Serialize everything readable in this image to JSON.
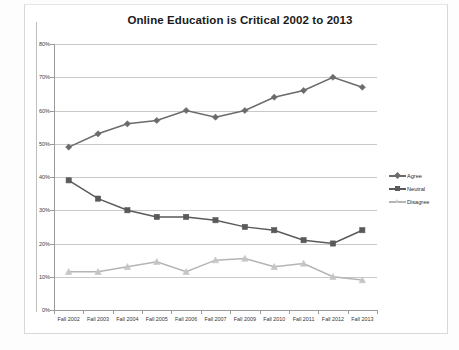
{
  "chart_data": {
    "type": "line",
    "title": "Online Education is Critical 2002 to 2013",
    "xlabel": "",
    "ylabel": "",
    "ylim": [
      0,
      80
    ],
    "y_tick_step": 10,
    "y_tick_labels": [
      "0%",
      "10%",
      "20%",
      "30%",
      "40%",
      "50%",
      "60%",
      "70%",
      "80%"
    ],
    "grid": "horizontal",
    "legend_position": "right",
    "categories": [
      "Fall 2002",
      "Fall 2003",
      "Fall 2004",
      "Fall 2005",
      "Fall 2006",
      "Fall 2007",
      "Fall 2009",
      "Fall 2010",
      "Fall 2011",
      "Fall 2012",
      "Fall 2013"
    ],
    "series": [
      {
        "name": "Agree",
        "color": "#6b6b6b",
        "marker": "diamond",
        "values": [
          49,
          53,
          56,
          57,
          60,
          58,
          60,
          64,
          66,
          70,
          67
        ]
      },
      {
        "name": "Neutral",
        "color": "#5a5a5a",
        "marker": "square",
        "values": [
          39,
          33.5,
          30,
          28,
          28,
          27,
          25,
          24,
          21,
          20,
          24
        ]
      },
      {
        "name": "Disagree",
        "color": "#b4b4b4",
        "marker": "triangle",
        "values": [
          11.5,
          11.5,
          13,
          14.5,
          11.5,
          15,
          15.5,
          13,
          14,
          10,
          9
        ]
      }
    ]
  },
  "legend": {
    "items": [
      {
        "label": "Agree"
      },
      {
        "label": "Neutral"
      },
      {
        "label": "Disagree"
      }
    ]
  },
  "colors": {
    "agree": "#6b6b6b",
    "neutral": "#5a5a5a",
    "disagree": "#b4b4b4",
    "gridline": "#c9c9c9",
    "axis": "#9a9a9a",
    "text": "#2b2b2b"
  }
}
